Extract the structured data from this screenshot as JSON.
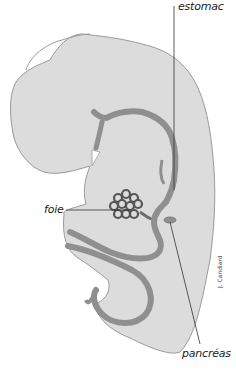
{
  "diagram": {
    "labels": {
      "stomach": "estomac",
      "liver": "foie",
      "pancreas": "pancréas"
    },
    "credit": "J. Candiard",
    "colors": {
      "background": "#ffffff",
      "embryo_body": "#dcdcdc",
      "embryo_outline": "#9a9a9a",
      "gut_tube": "#8f8f8f",
      "gut_outline": "#6e6e6e",
      "liver": "#555555",
      "leader_line": "#333333"
    }
  }
}
